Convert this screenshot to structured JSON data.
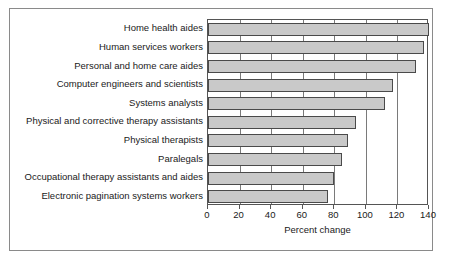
{
  "chart_data": {
    "type": "bar",
    "orientation": "horizontal",
    "title": "",
    "xlabel": "Percent change",
    "ylabel": "",
    "xlim": [
      0,
      140
    ],
    "xticks": [
      0,
      20,
      40,
      60,
      80,
      100,
      120,
      140
    ],
    "xtick_labels": [
      "0",
      "20",
      "40",
      "60",
      "80",
      "100",
      "120",
      "140"
    ],
    "grid": true,
    "grid_axis": "x",
    "legend": false,
    "categories": [
      "Home health aides",
      "Human services workers",
      "Personal and home care aides",
      "Computer engineers and scientists",
      "Systems analysts",
      "Physical and corrective therapy assistants",
      "Physical therapists",
      "Paralegals",
      "Occupational therapy assistants and aides",
      "Electronic pagination systems workers"
    ],
    "values": [
      140,
      137,
      132,
      117,
      112,
      94,
      89,
      85,
      80,
      76
    ],
    "bar_color": "#c9c9c9",
    "bar_edge_color": "#4a4a4a"
  },
  "figure": {
    "frame_color": "#8a8a8a",
    "axis_color": "#555555",
    "background": "#ffffff"
  }
}
